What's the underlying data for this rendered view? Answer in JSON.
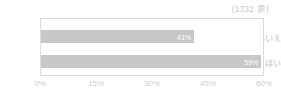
{
  "annotation": {
    "total_votes_label": "(1332 票)"
  },
  "chart_data": {
    "type": "bar",
    "orientation": "horizontal",
    "title": "",
    "subtitle": "",
    "xlabel": "",
    "ylabel": "",
    "categories": [
      "いいえ",
      "はい"
    ],
    "values": [
      41,
      59
    ],
    "value_labels": [
      "41%",
      "59%"
    ],
    "xlim": [
      0,
      60
    ],
    "xticks": [
      0,
      15,
      30,
      45,
      60
    ],
    "xtick_labels": [
      "0%",
      "15%",
      "30%",
      "45%",
      "60%"
    ],
    "grid": false,
    "legend": false,
    "annotation": "(1332 票)",
    "total_votes": 1332,
    "bar_color": "#c8c8c8",
    "value_label_color": "#ffffff",
    "axis_text_color": "#cfcfcf",
    "border_color": "#dcdcdc",
    "background": "#ffffff"
  }
}
